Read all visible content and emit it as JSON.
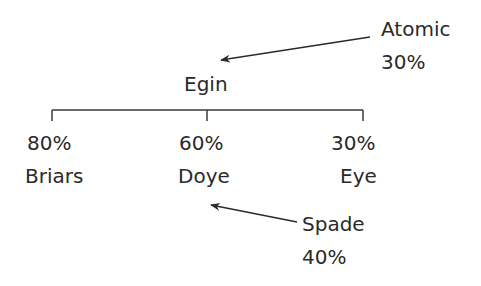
{
  "root": {
    "label": "Egin"
  },
  "children": [
    {
      "percent": "80%",
      "label": "Briars"
    },
    {
      "percent": "60%",
      "label": "Doye"
    },
    {
      "percent": "30%",
      "label": "Eye"
    }
  ],
  "annotations": [
    {
      "label": "Atomic",
      "percent": "30%",
      "points_to": "Egin"
    },
    {
      "label": "Spade",
      "percent": "40%",
      "points_to": "Doye"
    }
  ],
  "colors": {
    "line": "#3a3a3a",
    "text": "#2a2a2a",
    "background": "#ffffff"
  }
}
